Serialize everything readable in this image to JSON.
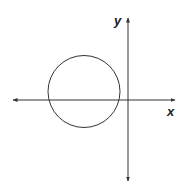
{
  "diagram": {
    "x_axis_label": "x",
    "y_axis_label": "y",
    "colors": {
      "stroke": "#333333",
      "background": "#ffffff"
    },
    "circle": {
      "cx": 84,
      "cy": 91.5,
      "r": 36
    },
    "x_axis": {
      "y": 100,
      "x1": 13,
      "x2": 175
    },
    "y_axis": {
      "x": 128,
      "y1": 18,
      "y2": 181
    }
  }
}
